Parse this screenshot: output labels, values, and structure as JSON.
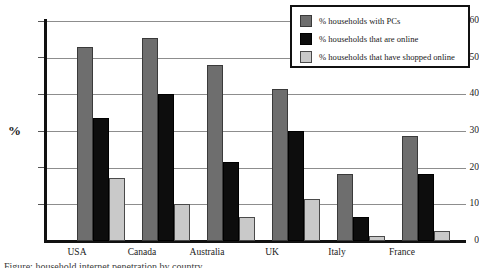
{
  "chart_data": {
    "type": "bar",
    "title": "",
    "xlabel": "",
    "ylabel": "%",
    "ylim": [
      0,
      60
    ],
    "yticks": [
      0,
      10,
      20,
      30,
      40,
      50,
      60
    ],
    "grid": true,
    "legend_position": "top-right",
    "categories": [
      "USA",
      "Canada",
      "Australia",
      "UK",
      "Italy",
      "France"
    ],
    "series": [
      {
        "name": "% households with PCs",
        "color": "#6e6e6e",
        "values": [
          53.0,
          55.5,
          48.0,
          41.5,
          18.3,
          28.7
        ]
      },
      {
        "name": "% households that are online",
        "color": "#0d0d0d",
        "values": [
          33.5,
          40.0,
          21.5,
          30.0,
          6.5,
          18.3
        ]
      },
      {
        "name": "% households that have shopped online",
        "color": "#c9c9c9",
        "values": [
          17.2,
          10.0,
          6.6,
          11.5,
          1.3,
          2.7
        ]
      }
    ]
  },
  "axis": {
    "y_title": "%",
    "tick_labels": [
      "60",
      "50",
      "40",
      "30",
      "20",
      "10",
      "0"
    ]
  },
  "legend": {
    "items": [
      {
        "label": "% households with PCs",
        "swatch": "#6e6e6e"
      },
      {
        "label": "% households that are online",
        "swatch": "#0d0d0d"
      },
      {
        "label": "% households that have shopped online",
        "swatch": "#c9c9c9"
      }
    ]
  },
  "caption": {
    "cropped_text": "Figure: household internet penetration by country"
  }
}
